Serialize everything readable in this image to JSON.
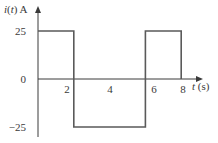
{
  "chart_data": {
    "type": "line",
    "subtype": "step / square wave",
    "title": "",
    "ylabel": "i(t) A",
    "xlabel": "t (s)",
    "ylabel_parts": {
      "italic": "i",
      "paren": "(",
      "var": "t",
      "close": ")",
      "unit": " A"
    },
    "xlabel_parts": {
      "var": "t",
      "unit": " (s)"
    },
    "x_ticks": [
      "2",
      "4",
      "6",
      "8"
    ],
    "y_ticks": [
      "25",
      "0",
      "−25"
    ],
    "xlim": [
      0,
      9
    ],
    "ylim": [
      -25,
      25
    ],
    "grid": false,
    "legend": null,
    "series": [
      {
        "name": "i(t)",
        "points": [
          {
            "t": 0,
            "i": 25
          },
          {
            "t": 2,
            "i": 25
          },
          {
            "t": 2,
            "i": -25
          },
          {
            "t": 6,
            "i": -25
          },
          {
            "t": 6,
            "i": 25
          },
          {
            "t": 8,
            "i": 25
          },
          {
            "t": 8,
            "i": 0
          }
        ]
      }
    ],
    "colors": {
      "axis": "#3a3a3a",
      "waveform": "#5a5a5a"
    }
  }
}
